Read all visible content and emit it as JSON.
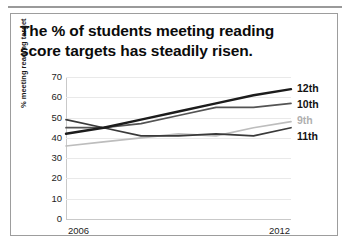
{
  "card": {
    "title": "The % of students meeting reading score targets has steadily risen."
  },
  "chart_data": {
    "type": "line",
    "title": "The % of students meeting reading score targets has steadily risen.",
    "xlabel": "",
    "ylabel": "% meeting reading target",
    "x": [
      2006,
      2007,
      2008,
      2009,
      2010,
      2011,
      2012
    ],
    "xtick_labels": [
      "2006",
      "2012"
    ],
    "ytick_labels": [
      "0",
      "10",
      "20",
      "30",
      "40",
      "50",
      "60",
      "70"
    ],
    "yticks": [
      0,
      10,
      20,
      30,
      40,
      50,
      60,
      70
    ],
    "ylim": [
      0,
      70
    ],
    "grid": true,
    "legend_position": "right",
    "series": [
      {
        "name": "12th",
        "color": "#1c1c1c",
        "values": [
          42,
          45,
          49,
          53,
          57,
          61,
          64
        ]
      },
      {
        "name": "10th",
        "color": "#545454",
        "values": [
          45,
          45,
          47,
          51,
          55,
          55,
          57
        ]
      },
      {
        "name": "9th",
        "color": "#bdbdbd",
        "values": [
          36,
          38,
          40,
          42,
          41,
          45,
          48
        ]
      },
      {
        "name": "11th",
        "color": "#3a3a3a",
        "values": [
          49,
          45,
          41,
          41,
          42,
          41,
          45
        ]
      }
    ]
  }
}
